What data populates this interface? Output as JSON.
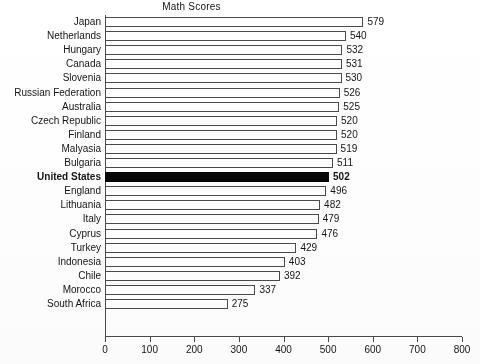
{
  "chart_data": {
    "type": "bar",
    "orientation": "horizontal",
    "title": "Math Scores",
    "xlabel": "",
    "ylabel": "",
    "xlim": [
      0,
      800
    ],
    "xticks": [
      0,
      100,
      200,
      300,
      400,
      500,
      600,
      700,
      800
    ],
    "xtick_labels": [
      "0",
      "100",
      "200",
      "300",
      "400",
      "500",
      "600",
      "700",
      "800"
    ],
    "grid": false,
    "legend": null,
    "highlight_category": "United States",
    "highlight_color": "#060606",
    "bar_color": "#ffffff",
    "bar_edge_color": "#4a4a4a",
    "categories": [
      "Japan",
      "Netherlands",
      "Hungary",
      "Canada",
      "Slovenia",
      "Russian Federation",
      "Australia",
      "Czech Republic",
      "Finland",
      "Malyasia",
      "Bulgaria",
      "United States",
      "England",
      "Lithuania",
      "Italy",
      "Cyprus",
      "Turkey",
      "Indonesia",
      "Chile",
      "Morocco",
      "South Africa"
    ],
    "values": [
      579,
      540,
      532,
      531,
      530,
      526,
      525,
      520,
      520,
      519,
      511,
      502,
      496,
      482,
      479,
      476,
      429,
      403,
      392,
      337,
      275
    ],
    "value_labels": [
      "579",
      "540",
      "532",
      "531",
      "530",
      "526",
      "525",
      "520",
      "520",
      "519",
      "511",
      "502",
      "496",
      "482",
      "479",
      "476",
      "429",
      "403",
      "392",
      "337",
      "275"
    ]
  }
}
